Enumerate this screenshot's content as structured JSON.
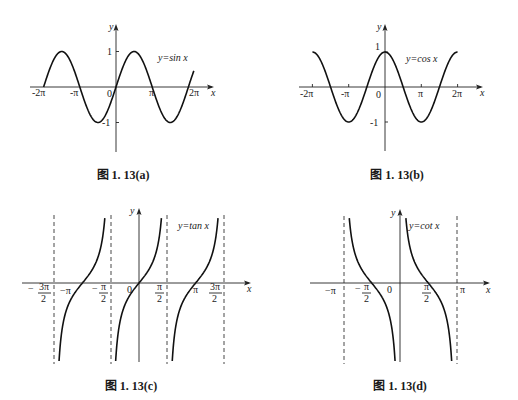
{
  "chart_data": [
    {
      "id": "a",
      "type": "line",
      "function": "sin",
      "title": "",
      "caption": "图 1. 13(a)",
      "equation_label": "y=sin x",
      "xlabel": "x",
      "ylabel": "y",
      "x_ticks": [
        "-2π",
        "-π",
        "0",
        "π",
        "2π"
      ],
      "y_ticks": [
        "1",
        "-1"
      ],
      "xlim_over_pi": [
        -2,
        2.15
      ],
      "ylim": [
        -1,
        1
      ],
      "grid": false,
      "asymptotes_over_pi": [],
      "sample_points": [
        {
          "x": "-2π",
          "y": 0
        },
        {
          "x": "-3π/2",
          "y": 1
        },
        {
          "x": "-π",
          "y": 0
        },
        {
          "x": "-π/2",
          "y": -1
        },
        {
          "x": "0",
          "y": 0
        },
        {
          "x": "π/2",
          "y": 1
        },
        {
          "x": "π",
          "y": 0
        },
        {
          "x": "3π/2",
          "y": -1
        },
        {
          "x": "2π",
          "y": 0
        }
      ],
      "layout": {
        "ox": 116,
        "oy": 87,
        "pi_px": 36.2,
        "amp_px": 35.5,
        "x_axis": [
          30,
          214
        ],
        "y_axis": [
          25,
          152
        ],
        "eq_pos": [
          158,
          62
        ],
        "caption_pos": [
          123,
          179
        ]
      }
    },
    {
      "id": "b",
      "type": "line",
      "function": "cos",
      "title": "",
      "caption": "图 1. 13(b)",
      "equation_label": "y=cos x",
      "xlabel": "x",
      "ylabel": "y",
      "x_ticks": [
        "-2π",
        "-π",
        "0",
        "π",
        "2π"
      ],
      "y_ticks": [
        "1",
        "-1"
      ],
      "xlim_over_pi": [
        -2,
        2
      ],
      "ylim": [
        -1,
        1
      ],
      "grid": false,
      "asymptotes_over_pi": [],
      "sample_points": [
        {
          "x": "-2π",
          "y": 1
        },
        {
          "x": "-3π/2",
          "y": 0
        },
        {
          "x": "-π",
          "y": -1
        },
        {
          "x": "-π/2",
          "y": 0
        },
        {
          "x": "0",
          "y": 1
        },
        {
          "x": "π/2",
          "y": 0
        },
        {
          "x": "π",
          "y": -1
        },
        {
          "x": "3π/2",
          "y": 0
        },
        {
          "x": "2π",
          "y": 1
        }
      ],
      "layout": {
        "ox": 385,
        "oy": 87,
        "pi_px": 36.3,
        "amp_px": 35,
        "x_axis": [
          299,
          483
        ],
        "y_axis": [
          25,
          151
        ],
        "eq_pos": [
          406,
          62
        ],
        "caption_pos": [
          397,
          179
        ]
      }
    },
    {
      "id": "c",
      "type": "line",
      "function": "tan",
      "title": "",
      "caption": "图 1. 13(c)",
      "equation_label": "y=tan x",
      "xlabel": "x",
      "ylabel": "y",
      "x_ticks": [
        "-3π/2",
        "-π",
        "-π/2",
        "0",
        "π/2",
        "π",
        "3π/2"
      ],
      "y_ticks": [],
      "xlim_over_pi": [
        -1.5,
        1.5
      ],
      "ylim": "unbounded",
      "grid": false,
      "asymptotes_over_pi": [
        -1.5,
        -0.5,
        0.5,
        1.5
      ],
      "sample_points": [
        {
          "x": "-π",
          "y": 0
        },
        {
          "x": "-3π/4",
          "y": 1
        },
        {
          "x": "-5π/4",
          "y": -1
        },
        {
          "x": "0",
          "y": 0
        },
        {
          "x": "π/4",
          "y": 1
        },
        {
          "x": "-π/4",
          "y": -1
        },
        {
          "x": "π",
          "y": 0
        },
        {
          "x": "5π/4",
          "y": 1
        },
        {
          "x": "3π/4",
          "y": -1
        }
      ],
      "layout": {
        "ox": 139,
        "oy": 283,
        "pi_px": 56.6,
        "unit_px": 22,
        "x_axis": [
          22,
          251
        ],
        "y_axis": [
          209,
          362
        ],
        "curve_y": [
          217,
          362
        ],
        "eq_pos": [
          178,
          229
        ],
        "caption_pos": [
          131,
          390
        ]
      }
    },
    {
      "id": "d",
      "type": "line",
      "function": "cot",
      "title": "",
      "caption": "图 1. 13(d)",
      "equation_label": "y=cot x",
      "xlabel": "x",
      "ylabel": "y",
      "x_ticks": [
        "-π",
        "-π/2",
        "0",
        "π/2",
        "π"
      ],
      "y_ticks": [],
      "xlim_over_pi": [
        -1,
        1
      ],
      "ylim": "unbounded",
      "grid": false,
      "asymptotes_over_pi": [
        -1,
        1
      ],
      "sample_points": [
        {
          "x": "-π/2",
          "y": 0
        },
        {
          "x": "-3π/4",
          "y": 1
        },
        {
          "x": "-π/4",
          "y": -1
        },
        {
          "x": "π/2",
          "y": 0
        },
        {
          "x": "π/4",
          "y": 1
        },
        {
          "x": "3π/4",
          "y": -1
        }
      ],
      "layout": {
        "ox": 400,
        "oy": 283,
        "pi_px": 56.6,
        "unit_px": 22,
        "x_axis": [
          310,
          490
        ],
        "y_axis": [
          210,
          362
        ],
        "curve_y": [
          218,
          362
        ],
        "eq_pos": [
          409,
          229
        ],
        "caption_pos": [
          400,
          390
        ]
      }
    }
  ],
  "figure": {
    "captions": [
      "图 1. 13(a)",
      "图 1. 13(b)",
      "图 1. 13(c)",
      "图 1. 13(d)"
    ],
    "colors": {
      "background": "#ffffff",
      "ink": "#111111"
    }
  }
}
